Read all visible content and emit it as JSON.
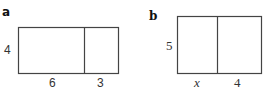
{
  "panels": [
    {
      "label": "a",
      "height_label": "4",
      "widths": [
        "6",
        "3"
      ]
    },
    {
      "label": "b",
      "height_label": "5",
      "widths": [
        "x",
        "4"
      ]
    }
  ],
  "colors": {
    "stroke": "#444444",
    "text": "#333333",
    "background": "#ffffff"
  }
}
